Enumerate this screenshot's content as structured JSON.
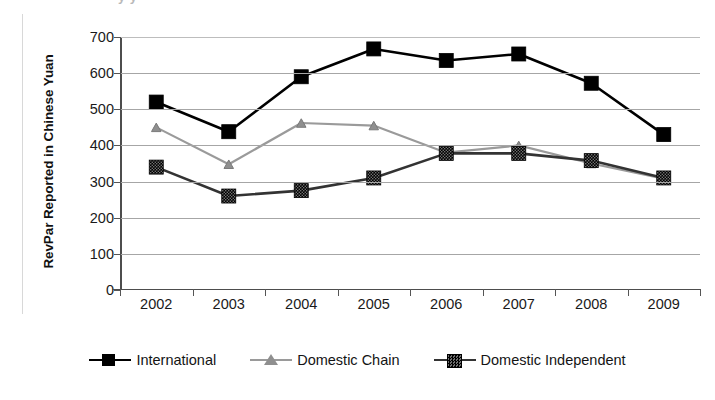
{
  "chart_data": {
    "type": "line",
    "title": "",
    "xlabel": "",
    "ylabel": "RevPar Reported in Chinese Yuan",
    "categories": [
      "2002",
      "2003",
      "2004",
      "2005",
      "2006",
      "2007",
      "2008",
      "2009"
    ],
    "ylim": [
      0,
      700
    ],
    "ytick_step": 100,
    "yticks": [
      "0",
      "100",
      "200",
      "300",
      "400",
      "500",
      "600",
      "700"
    ],
    "grid": true,
    "legend_position": "bottom",
    "series": [
      {
        "name": "International",
        "color": "#000000",
        "marker": "square",
        "values": [
          520,
          438,
          590,
          667,
          635,
          653,
          572,
          430
        ]
      },
      {
        "name": "Domestic Chain",
        "color": "#9a9a9a",
        "marker": "triangle",
        "values": [
          450,
          348,
          462,
          455,
          380,
          400,
          350,
          308
        ]
      },
      {
        "name": "Domestic Independent",
        "color": "#333333",
        "marker": "square-textured",
        "values": [
          340,
          260,
          275,
          310,
          378,
          378,
          358,
          310
        ]
      }
    ]
  },
  "artifacts": {
    "top_crop_text": "y  y"
  }
}
